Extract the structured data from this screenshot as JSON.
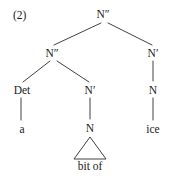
{
  "figure": {
    "example_number": "(2)",
    "type": "syntax-tree",
    "width": 174,
    "height": 178,
    "background_color": "#ffffff",
    "line_color": "#2b2b2b",
    "text_color": "#1a1a1a"
  },
  "tree": {
    "nodes": [
      {
        "id": "root",
        "label": "N″",
        "x": 103,
        "y": 9,
        "kind": "phrase"
      },
      {
        "id": "nbar2",
        "label": "N″",
        "x": 52,
        "y": 48,
        "kind": "phrase"
      },
      {
        "id": "nbar-r",
        "label": "N′",
        "x": 153,
        "y": 48,
        "kind": "bar"
      },
      {
        "id": "det",
        "label": "Det",
        "x": 22,
        "y": 85,
        "kind": "head"
      },
      {
        "id": "nbar-mid",
        "label": "N′",
        "x": 90,
        "y": 85,
        "kind": "bar"
      },
      {
        "id": "n-right",
        "label": "N",
        "x": 153,
        "y": 85,
        "kind": "head"
      },
      {
        "id": "n-mid",
        "label": "N",
        "x": 90,
        "y": 123,
        "kind": "head"
      }
    ],
    "terminals": [
      {
        "id": "term-a",
        "label": "a",
        "x": 22,
        "y": 124
      },
      {
        "id": "term-ice",
        "label": "ice",
        "x": 153,
        "y": 124
      },
      {
        "id": "term-bit-of",
        "label": "bit of",
        "x": 90,
        "y": 161
      }
    ],
    "branches": [
      {
        "id": "root-to-nbar2",
        "from": "root",
        "to": "nbar2",
        "x1": 101,
        "y1": 23,
        "x2": 54,
        "y2": 45,
        "style": "diagonal"
      },
      {
        "id": "root-to-nbar-r",
        "from": "root",
        "to": "nbar-r",
        "x1": 108,
        "y1": 23,
        "x2": 152,
        "y2": 45,
        "style": "diagonal"
      },
      {
        "id": "nbar2-to-det",
        "from": "nbar2",
        "to": "det",
        "x1": 50,
        "y1": 61,
        "x2": 23,
        "y2": 82,
        "style": "diagonal"
      },
      {
        "id": "nbar2-to-nbarmid",
        "from": "nbar2",
        "to": "nbar-mid",
        "x1": 57,
        "y1": 61,
        "x2": 89,
        "y2": 82,
        "style": "diagonal"
      },
      {
        "id": "det-to-a",
        "from": "det",
        "to": "term-a",
        "x1": 21,
        "y1": 98,
        "x2": 21,
        "y2": 120,
        "style": "vertical"
      },
      {
        "id": "nbarmid-to-nmid",
        "from": "nbar-mid",
        "to": "n-mid",
        "x1": 90,
        "y1": 98,
        "x2": 90,
        "y2": 119,
        "style": "vertical"
      },
      {
        "id": "nbarr-to-nright",
        "from": "nbar-r",
        "to": "n-right",
        "x1": 153,
        "y1": 61,
        "x2": 153,
        "y2": 81,
        "style": "vertical"
      },
      {
        "id": "nright-to-ice",
        "from": "n-right",
        "to": "term-ice",
        "x1": 153,
        "y1": 98,
        "x2": 153,
        "y2": 120,
        "style": "vertical"
      }
    ],
    "triangle": {
      "id": "bit-of-triangle",
      "parent": "n-mid",
      "dominates": "bit of",
      "apex_x": 90,
      "apex_y": 137,
      "left_x": 74,
      "right_x": 106,
      "base_y": 159
    }
  }
}
